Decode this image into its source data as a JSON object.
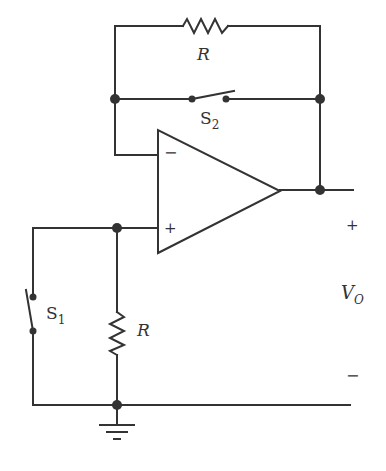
{
  "diagram": {
    "type": "op-amp circuit schematic",
    "colors": {
      "ink": "#333333",
      "background": "#ffffff"
    },
    "components": {
      "feedback_resistor": {
        "label": "R"
      },
      "feedback_switch": {
        "label": "S",
        "subscript": "2"
      },
      "input_switch": {
        "label": "S",
        "subscript": "1"
      },
      "shunt_resistor": {
        "label": "R"
      },
      "op_amp": {
        "inverting_label": "−",
        "noninverting_label": "+"
      },
      "ground": {
        "label": ""
      }
    },
    "output": {
      "label": "V",
      "subscript": "O",
      "plus_label": "+",
      "minus_label": "−"
    }
  }
}
